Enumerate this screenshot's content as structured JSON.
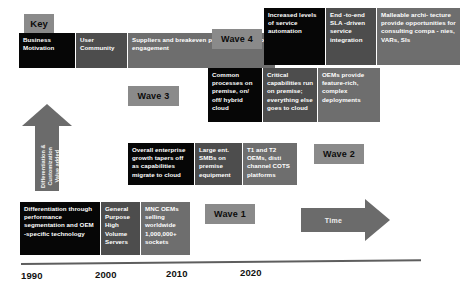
{
  "diagram": {
    "title_label": "Key",
    "axis": {
      "ticks": [
        "1990",
        "2000",
        "2010",
        "2020"
      ]
    },
    "vertical_axis": {
      "label": "Differentiation &amp; Customization Value added",
      "line1": "Differentiation &",
      "line2": "Customization",
      "line3": "Value added",
      "icon": "up-arrow-icon"
    },
    "time_axis": {
      "label": "Time",
      "icon": "right-arrow-icon"
    },
    "legend": {
      "label": "Key",
      "items": [
        {
          "text": "Business Motivation",
          "color": "#060606",
          "swatch": "business-motivation"
        },
        {
          "text": "User Community",
          "color": "#4d4d4d",
          "swatch": "user-community"
        },
        {
          "text": "Suppliers and breakeven production  scale per engagement",
          "color": "#6e6e6e",
          "swatch": "suppliers-breakeven"
        }
      ]
    },
    "waves": [
      {
        "name": "Wave 4",
        "boxes": [
          {
            "text": "Increased levels of service automation",
            "color": "#060606"
          },
          {
            "text": "End -to-end SLA -driven service integration",
            "color": "#4d4d4d"
          },
          {
            "text": "Malleable archi- tecture provide opportunities for consulting compa - nies, VARs, SIs",
            "color": "#6e6e6e"
          }
        ]
      },
      {
        "name": "Wave 3",
        "boxes": [
          {
            "text": "Common processes on premise,  on/ off/ hybrid cloud",
            "color": "#060606"
          },
          {
            "text": "Critical capabilities run on premise; everything else goes to cloud",
            "color": "#4d4d4d"
          },
          {
            "text": "OEMs provide feature-rich, complex deployments",
            "color": "#6e6e6e"
          }
        ]
      },
      {
        "name": "Wave 2",
        "boxes": [
          {
            "text": "Overall enterprise growth tapers off as capabilities migrate to cloud",
            "color": "#060606"
          },
          {
            "text": "Large ent. SMBs on premise equipment",
            "color": "#4d4d4d"
          },
          {
            "text": "T1 and T2 OEMs,  disti channel COTS platforms",
            "color": "#6e6e6e"
          }
        ]
      },
      {
        "name": "Wave 1",
        "boxes": [
          {
            "text": "Differentiation through performance segmentation and OEM -specific technology",
            "color": "#060606"
          },
          {
            "text": "General Purpose High Volume Servers",
            "color": "#4d4d4d"
          },
          {
            "text": "MNC OEMs selling worldwide 1,000,000+ sockets",
            "color": "#6e6e6e"
          }
        ]
      }
    ]
  }
}
